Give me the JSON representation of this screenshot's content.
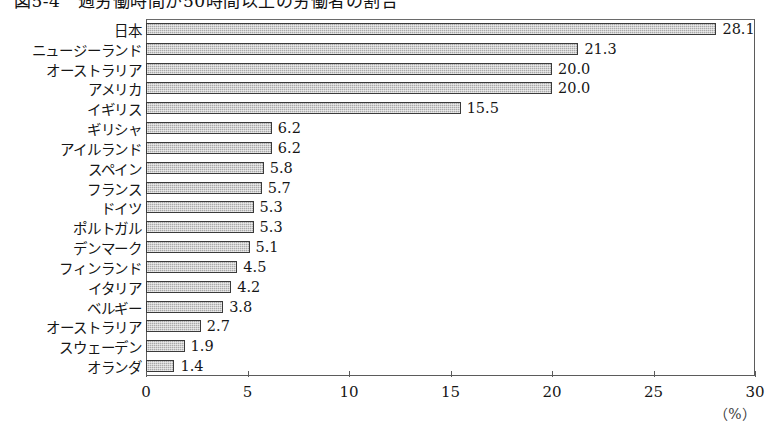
{
  "title": "図5-4　週労働時間が50時間以上の労働者の割合",
  "axis": {
    "unit": "（%）",
    "ticks": [
      {
        "value": 0,
        "label": "0"
      },
      {
        "value": 5,
        "label": "5"
      },
      {
        "value": 10,
        "label": "10"
      },
      {
        "value": 15,
        "label": "15"
      },
      {
        "value": 20,
        "label": "20"
      },
      {
        "value": 25,
        "label": "25"
      },
      {
        "value": 30,
        "label": "30"
      }
    ]
  },
  "chart_data": {
    "type": "bar",
    "orientation": "horizontal",
    "title": "図5-4　週労働時間が50時間以上の労働者の割合",
    "xlabel": "（%）",
    "ylabel": "",
    "xlim": [
      0,
      30
    ],
    "grid": false,
    "legend": null,
    "xticks": [
      0,
      5,
      10,
      15,
      20,
      25,
      30
    ],
    "categories": [
      "日本",
      "ニュージーランド",
      "オーストラリア",
      "アメリカ",
      "イギリス",
      "ギリシャ",
      "アイルランド",
      "スペイン",
      "フランス",
      "ドイツ",
      "ポルトガル",
      "デンマーク",
      "フィンランド",
      "イタリア",
      "ベルギー",
      "オーストラリア",
      "スウェーデン",
      "オランダ"
    ],
    "values": [
      28.1,
      21.3,
      20.0,
      20.0,
      15.5,
      6.2,
      6.2,
      5.8,
      5.7,
      5.3,
      5.3,
      5.1,
      4.5,
      4.2,
      3.8,
      2.7,
      1.9,
      1.4
    ],
    "value_labels": [
      "28.1",
      "21.3",
      "20.0",
      "20.0",
      "15.5",
      "6.2",
      "6.2",
      "5.8",
      "5.7",
      "5.3",
      "5.3",
      "5.1",
      "4.5",
      "4.2",
      "3.8",
      "2.7",
      "1.9",
      "1.4"
    ],
    "colors": {
      "bar_fill": "#a9a9a9",
      "bar_border": "#3a3a3a",
      "axis": "#5b5b5b",
      "text": "#161616"
    }
  }
}
